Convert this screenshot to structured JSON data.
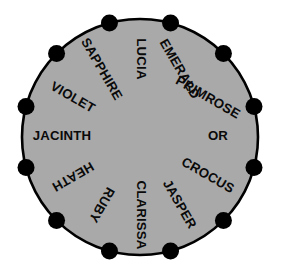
{
  "figure": {
    "name": "labelled-circle-wheel",
    "geometry": {
      "center_x": 140,
      "center_y": 137,
      "radius": 118,
      "vertex_count": 12,
      "vertex_dot_radius": 8.5,
      "label_radius": 78,
      "angle_step_deg": 30,
      "first_vertex_angle_deg": -90
    },
    "colors": {
      "disc_fill": "#a9a9a9",
      "disc_stroke": "#000000",
      "dot_fill": "#000000",
      "label_text": "#0a0a0a",
      "background": "#ffffff"
    },
    "labels": [
      {
        "text": "LUCIA",
        "angle_deg": -90,
        "rotation_deg": 90
      },
      {
        "text": "EMERALD",
        "angle_deg": -60,
        "rotation_deg": 60
      },
      {
        "text": "PRIMROSE",
        "angle_deg": -30,
        "rotation_deg": 30
      },
      {
        "text": "OR",
        "angle_deg": 0,
        "rotation_deg": 0
      },
      {
        "text": "CROCUS",
        "angle_deg": 30,
        "rotation_deg": 30
      },
      {
        "text": "JASPER",
        "angle_deg": 60,
        "rotation_deg": 60
      },
      {
        "text": "CLARISSA",
        "angle_deg": 90,
        "rotation_deg": 90
      },
      {
        "text": "RUBY",
        "angle_deg": 120,
        "rotation_deg": 120
      },
      {
        "text": "HEATH",
        "angle_deg": 150,
        "rotation_deg": 150
      },
      {
        "text": "JACINTH",
        "angle_deg": 180,
        "rotation_deg": 0
      },
      {
        "text": "VIOLET",
        "angle_deg": 210,
        "rotation_deg": 30
      },
      {
        "text": "SAPPHIRE",
        "angle_deg": 240,
        "rotation_deg": 60
      }
    ],
    "vertices": [
      {
        "index": 0,
        "angle_deg": -75
      },
      {
        "index": 1,
        "angle_deg": -45
      },
      {
        "index": 2,
        "angle_deg": -15
      },
      {
        "index": 3,
        "angle_deg": 15
      },
      {
        "index": 4,
        "angle_deg": 45
      },
      {
        "index": 5,
        "angle_deg": 75
      },
      {
        "index": 6,
        "angle_deg": 105
      },
      {
        "index": 7,
        "angle_deg": 135
      },
      {
        "index": 8,
        "angle_deg": 165
      },
      {
        "index": 9,
        "angle_deg": 195
      },
      {
        "index": 10,
        "angle_deg": 225
      },
      {
        "index": 11,
        "angle_deg": 255
      }
    ]
  }
}
